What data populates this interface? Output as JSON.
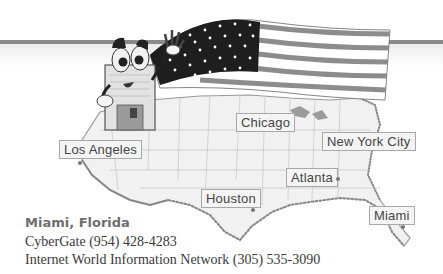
{
  "map": {
    "region": "Continental United States",
    "cities": [
      {
        "name": "Los Angeles"
      },
      {
        "name": "Chicago"
      },
      {
        "name": "New York City"
      },
      {
        "name": "Atlanta"
      },
      {
        "name": "Houston"
      },
      {
        "name": "Miami"
      }
    ]
  },
  "illustration": {
    "character": "floppy-disk-mascot-waving",
    "flag": "us-flag"
  },
  "listing": {
    "title": "Miami, Florida",
    "providers": [
      "CyberGate (954) 428-4283",
      "Internet World Information Network (305) 535-3090"
    ]
  }
}
